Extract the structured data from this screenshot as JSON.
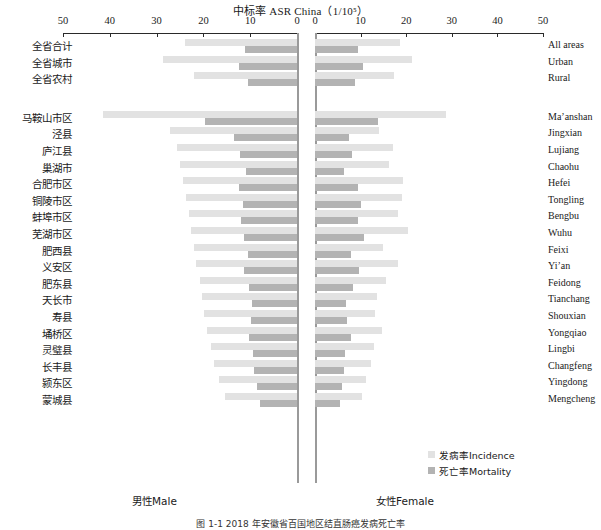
{
  "chart_data": {
    "type": "bar",
    "orientation": "horizontal-diverging",
    "title": "中标率 ASR China（1/10⁵）",
    "xlabel": "",
    "ylabel": "",
    "grid": false,
    "legend_position": "inside-bottom-right",
    "axis": {
      "left_panel_label": "男性Male",
      "right_panel_label": "女性Female",
      "left_ticks": [
        50,
        40,
        30,
        20,
        10,
        0
      ],
      "right_ticks": [
        0,
        10,
        20,
        30,
        40,
        50
      ],
      "left_xlim": [
        50,
        0
      ],
      "right_xlim": [
        0,
        50
      ]
    },
    "series": [
      {
        "name": "发病率Incidence",
        "color": "#e2e2e2"
      },
      {
        "name": "死亡率Mortality",
        "color": "#b3b3b3"
      }
    ],
    "categories": [
      {
        "cn": "全省合计",
        "en": "All areas",
        "male_incidence": 24.0,
        "male_mortality": 11.1,
        "female_incidence": 18.6,
        "female_mortality": 9.4
      },
      {
        "cn": "全省城市",
        "en": "Urban",
        "male_incidence": 28.6,
        "male_mortality": 12.5,
        "female_incidence": 21.3,
        "female_mortality": 10.6
      },
      {
        "cn": "全省农村",
        "en": "Rural",
        "male_incidence": 22.1,
        "male_mortality": 10.5,
        "female_incidence": 17.3,
        "female_mortality": 8.8
      },
      {
        "cn": "马鞍山市区",
        "en": "Ma’anshan",
        "male_incidence": 41.5,
        "male_mortality": 19.7,
        "female_incidence": 28.7,
        "female_mortality": 13.8
      },
      {
        "cn": "泾县",
        "en": "Jingxian",
        "male_incidence": 27.2,
        "male_mortality": 13.4,
        "female_incidence": 14.0,
        "female_mortality": 7.4
      },
      {
        "cn": "庐江县",
        "en": "Lujiang",
        "male_incidence": 25.6,
        "male_mortality": 12.2,
        "female_incidence": 17.2,
        "female_mortality": 8.2
      },
      {
        "cn": "巢湖市",
        "en": "Chaohu",
        "male_incidence": 24.9,
        "male_mortality": 10.8,
        "female_incidence": 16.2,
        "female_mortality": 6.3
      },
      {
        "cn": "合肥市区",
        "en": "Hefei",
        "male_incidence": 24.4,
        "male_mortality": 12.3,
        "female_incidence": 19.4,
        "female_mortality": 9.5
      },
      {
        "cn": "铜陵市区",
        "en": "Tongling",
        "male_incidence": 23.8,
        "male_mortality": 11.5,
        "female_incidence": 19.0,
        "female_mortality": 10.0
      },
      {
        "cn": "蚌埠市区",
        "en": "Bengbu",
        "male_incidence": 23.1,
        "male_mortality": 12.0,
        "female_incidence": 18.3,
        "female_mortality": 9.5
      },
      {
        "cn": "芜湖市区",
        "en": "Wuhu",
        "male_incidence": 22.6,
        "male_mortality": 11.4,
        "female_incidence": 20.4,
        "female_mortality": 10.8
      },
      {
        "cn": "肥西县",
        "en": "Feixi",
        "male_incidence": 22.0,
        "male_mortality": 10.4,
        "female_incidence": 15.0,
        "female_mortality": 7.9
      },
      {
        "cn": "义安区",
        "en": "Yi’an",
        "male_incidence": 21.5,
        "male_mortality": 11.4,
        "female_incidence": 18.2,
        "female_mortality": 9.7
      },
      {
        "cn": "肥东县",
        "en": "Feidong",
        "male_incidence": 20.8,
        "male_mortality": 10.3,
        "female_incidence": 15.6,
        "female_mortality": 8.4
      },
      {
        "cn": "天长市",
        "en": "Tianchang",
        "male_incidence": 20.3,
        "male_mortality": 9.7,
        "female_incidence": 13.6,
        "female_mortality": 6.8
      },
      {
        "cn": "寿县",
        "en": "Shouxian",
        "male_incidence": 19.8,
        "male_mortality": 9.9,
        "female_incidence": 13.2,
        "female_mortality": 7.1
      },
      {
        "cn": "埇桥区",
        "en": "Yongqiao",
        "male_incidence": 19.3,
        "male_mortality": 10.2,
        "female_incidence": 14.6,
        "female_mortality": 8.0
      },
      {
        "cn": "灵璧县",
        "en": "Lingbi",
        "male_incidence": 18.4,
        "male_mortality": 9.4,
        "female_incidence": 12.9,
        "female_mortality": 6.6
      },
      {
        "cn": "长丰县",
        "en": "Changfeng",
        "male_incidence": 17.8,
        "male_mortality": 9.1,
        "female_incidence": 12.3,
        "female_mortality": 6.4
      },
      {
        "cn": "颍东区",
        "en": "Yingdong",
        "male_incidence": 16.6,
        "male_mortality": 8.6,
        "female_incidence": 11.2,
        "female_mortality": 5.9
      },
      {
        "cn": "蒙城县",
        "en": "Mengcheng",
        "male_incidence": 15.4,
        "male_mortality": 8.0,
        "female_incidence": 10.4,
        "female_mortality": 5.4
      }
    ]
  },
  "colors": {
    "incidence": "#e2e2e2",
    "mortality": "#b3b3b3",
    "axis": "#2a2a2a",
    "center_rule": "#9a9a9a"
  },
  "footer": {
    "caption": "图 1-1  2018 年安徽省百国地区结直肠癌发病死亡率"
  }
}
